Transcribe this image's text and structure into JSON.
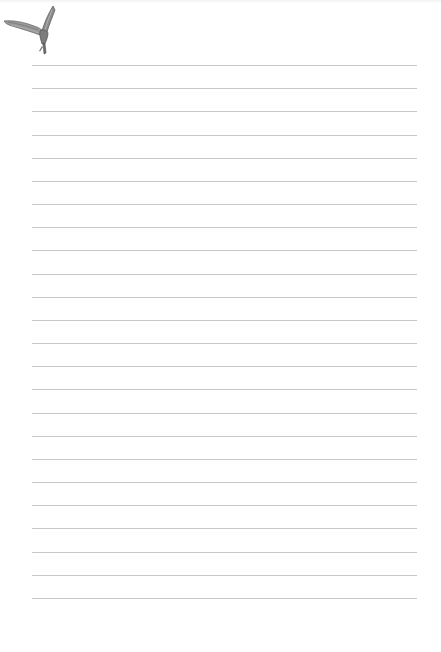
{
  "document": {
    "type": "lined-paper",
    "background_color": "#ffffff",
    "line_color": "#c8c8c8",
    "line_count": 24,
    "first_line_y": 65,
    "line_spacing": 23.17,
    "line_left": 32,
    "line_right": 417
  },
  "decoration": {
    "icon": "bird-icon",
    "colors": {
      "wing": "#8a8a8a",
      "shadow": "#5a5a5a",
      "highlight": "#c4c4c4"
    }
  }
}
